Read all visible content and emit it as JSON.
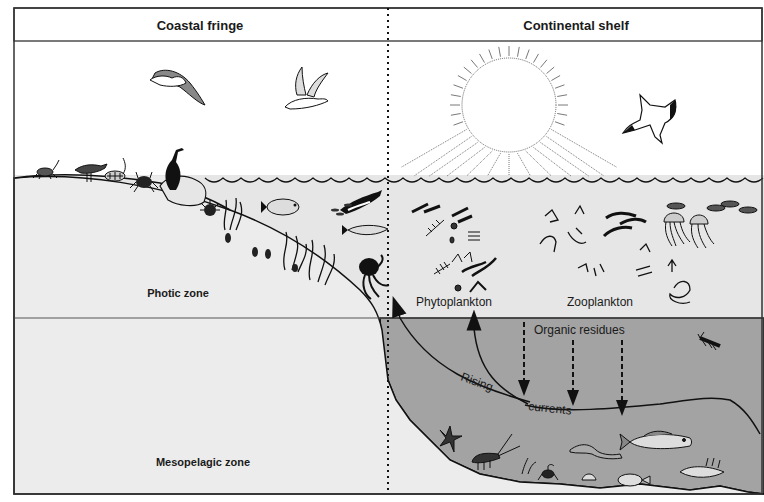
{
  "header": {
    "left_title": "Coastal fringe",
    "right_title": "Continental shelf"
  },
  "zones": {
    "photic": "Photic zone",
    "mesopelagic": "Mesopelagic zone"
  },
  "plankton": {
    "phyto": "Phytoplankton",
    "zoo": "Zooplankton"
  },
  "flows": {
    "organic": "Organic residues",
    "rising": "Rising",
    "currents": "currents"
  },
  "colors": {
    "sky": "#ffffff",
    "photic_water": "#e6e6e6",
    "deep_water": "#a3a3a3",
    "land": "#ececec",
    "ink": "#111111"
  }
}
